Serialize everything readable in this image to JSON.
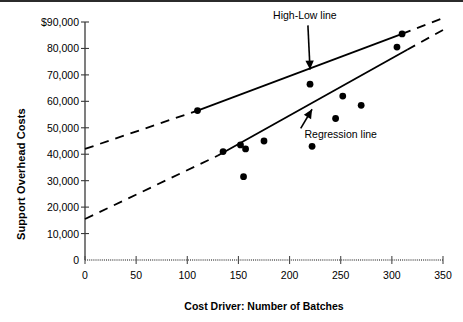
{
  "chart_data": {
    "type": "scatter",
    "title": "",
    "xlabel": "Cost Driver:  Number of Batches",
    "ylabel": "Support Overhead Costs",
    "xlim": [
      0,
      350
    ],
    "ylim": [
      0,
      90000
    ],
    "xticks": [
      0,
      50,
      100,
      150,
      200,
      250,
      300,
      350
    ],
    "xtick_labels": [
      "0",
      "50",
      "100",
      "150",
      "200",
      "250",
      "300",
      "350"
    ],
    "yticks": [
      0,
      10000,
      20000,
      30000,
      40000,
      50000,
      60000,
      70000,
      80000,
      90000
    ],
    "ytick_labels": [
      "0",
      "10,000",
      "20,000",
      "30,000",
      "40,000",
      "50,000",
      "60,000",
      "70,000",
      "80,000",
      "$90,000"
    ],
    "grid": false,
    "legend_position": "none",
    "points": [
      {
        "x": 110,
        "y": 56500
      },
      {
        "x": 135,
        "y": 41000
      },
      {
        "x": 152,
        "y": 43500
      },
      {
        "x": 157,
        "y": 42000
      },
      {
        "x": 155,
        "y": 31500
      },
      {
        "x": 175,
        "y": 45000
      },
      {
        "x": 220,
        "y": 66500
      },
      {
        "x": 222,
        "y": 43000
      },
      {
        "x": 245,
        "y": 53500
      },
      {
        "x": 252,
        "y": 62000
      },
      {
        "x": 270,
        "y": 58500
      },
      {
        "x": 305,
        "y": 80500
      },
      {
        "x": 310,
        "y": 85500
      }
    ],
    "series": [
      {
        "name": "High-Low line",
        "type": "line",
        "solid_segment": {
          "x1": 110,
          "y1": 56500,
          "x2": 310,
          "y2": 85500
        },
        "dashed_segments": [
          {
            "x1": 0,
            "y1": 42000,
            "x2": 110,
            "y2": 56500
          },
          {
            "x1": 310,
            "y1": 85500,
            "x2": 350,
            "y2": 91500
          }
        ]
      },
      {
        "name": "Regression line",
        "type": "line",
        "solid_segment": {
          "x1": 130,
          "y1": 39500,
          "x2": 315,
          "y2": 79500
        },
        "dashed_segments": [
          {
            "x1": 0,
            "y1": 15500,
            "x2": 130,
            "y2": 39500
          },
          {
            "x1": 315,
            "y1": 79500,
            "x2": 350,
            "y2": 87000
          }
        ]
      }
    ],
    "annotations": [
      {
        "label": "High-Low line",
        "text_x": 215,
        "text_y": 91000,
        "arrow_to_x": 220,
        "arrow_to_y": 72000
      },
      {
        "label": "Regression line",
        "text_x": 250,
        "text_y": 46000,
        "arrow_to_x": 222,
        "arrow_to_y": 57000
      }
    ]
  }
}
